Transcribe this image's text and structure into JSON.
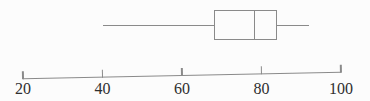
{
  "chart_data": {
    "type": "boxplot",
    "orientation": "horizontal",
    "title": "",
    "xlabel": "",
    "ylabel": "",
    "grid": false,
    "whisker_caps": false,
    "axis": {
      "min": 20,
      "max": 100,
      "tick_interval": 20
    },
    "ticks": [
      20,
      40,
      60,
      80,
      100
    ],
    "tick_labels": [
      "20",
      "40",
      "60",
      "80",
      "100"
    ],
    "five_number_summary": {
      "min": 40,
      "q1": 68,
      "median": 78,
      "q3": 84,
      "max": 92
    },
    "series": [
      {
        "name": "boxplot",
        "min": 40,
        "q1": 68,
        "median": 78,
        "q3": 84,
        "max": 92
      }
    ]
  },
  "colors": {
    "line": "#8a8a8a",
    "text": "#2f2f2f",
    "background": "#fcfcfc"
  }
}
